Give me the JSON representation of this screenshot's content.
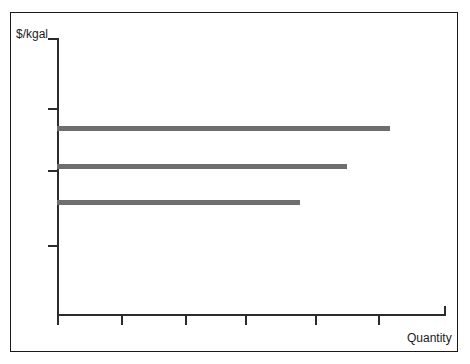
{
  "figure": {
    "background_color": "#ffffff",
    "frame_color": "#1a1a1a",
    "axis_color": "#2b2b2b",
    "bar_color": "#6e6e6e"
  },
  "labels": {
    "y_axis": "$/kgal",
    "x_axis": "Quantity"
  },
  "chart_data": {
    "type": "bar",
    "orientation": "horizontal",
    "title": "",
    "subtitle": "",
    "xlabel": "Quantity",
    "ylabel": "$/kgal",
    "grid": false,
    "legend": null,
    "legend_position": "none",
    "axis_tick_labels": {
      "x": [
        "",
        "",
        "",
        "",
        "",
        "",
        ""
      ],
      "y": [
        "",
        "",
        "",
        ""
      ]
    },
    "categories": [
      "bar-1",
      "bar-2",
      "bar-3"
    ],
    "series": [
      {
        "name": "supply step",
        "bars": [
          {
            "label": "bar-1",
            "price_level": 3,
            "quantity_extent": 5.2
          },
          {
            "label": "bar-2",
            "price_level": 2,
            "quantity_extent": 4.55
          },
          {
            "label": "bar-3",
            "price_level": 1,
            "quantity_extent": 3.8
          }
        ],
        "values": [
          5.2,
          4.55,
          3.8
        ]
      }
    ],
    "xlim": [
      0,
      6.1
    ],
    "ylim": [
      0,
      4.35
    ],
    "y_ticks": [
      0,
      1.1,
      2.1,
      4.35
    ],
    "x_ticks": [
      0,
      1.0,
      2.0,
      2.95,
      4.05,
      5.0,
      6.1
    ],
    "annotations": []
  },
  "geometry": {
    "bars": [
      {
        "name": "bar-top",
        "left": 57,
        "top": 126,
        "width": 333
      },
      {
        "name": "bar-middle",
        "left": 57,
        "top": 164,
        "width": 290
      },
      {
        "name": "bar-bottom",
        "left": 57,
        "top": 200,
        "width": 243
      }
    ],
    "y_ticks_px": [
      108,
      170,
      245
    ],
    "x_ticks_px": [
      57,
      121,
      185,
      245,
      315,
      378
    ]
  }
}
